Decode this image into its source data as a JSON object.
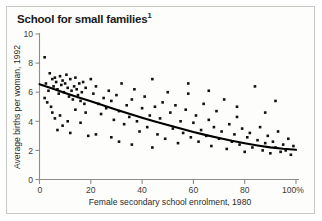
{
  "figure": {
    "title": "School for small families",
    "title_superscript": "1",
    "background_color": "#fdfdfb",
    "border_color": "#c8c8c4"
  },
  "chart_data": {
    "type": "scatter",
    "title": "School for small families",
    "xlabel": "Female secondary school enrolment, 1980",
    "ylabel": "Average births per woman, 1992",
    "xlim": [
      0,
      100
    ],
    "ylim": [
      0,
      10
    ],
    "xticks": [
      0,
      20,
      40,
      60,
      80,
      100
    ],
    "xtick_labels": [
      "0",
      "20",
      "40",
      "60",
      "80",
      "100%"
    ],
    "yticks": [
      0,
      2,
      4,
      6,
      8,
      10
    ],
    "ytick_labels": [
      "0",
      "2",
      "4",
      "6",
      "8",
      "10"
    ],
    "grid": false,
    "legend": null,
    "marker_color": "#111111",
    "marker_shape": "square",
    "trend": {
      "name": "fitted curve",
      "color": "#000000",
      "points": [
        [
          0.0,
          6.55
        ],
        [
          5.0,
          6.25
        ],
        [
          10.0,
          5.95
        ],
        [
          15.0,
          5.66
        ],
        [
          20.0,
          5.37
        ],
        [
          25.0,
          5.08
        ],
        [
          30.0,
          4.8
        ],
        [
          35.0,
          4.52
        ],
        [
          40.0,
          4.25
        ],
        [
          45.0,
          3.99
        ],
        [
          50.0,
          3.74
        ],
        [
          55.0,
          3.5
        ],
        [
          60.0,
          3.27
        ],
        [
          65.0,
          3.05
        ],
        [
          70.0,
          2.85
        ],
        [
          75.0,
          2.66
        ],
        [
          80.0,
          2.49
        ],
        [
          85.0,
          2.34
        ],
        [
          90.0,
          2.21
        ],
        [
          95.0,
          2.11
        ],
        [
          100.0,
          2.04
        ]
      ]
    },
    "points": [
      [
        2.0,
        8.4
      ],
      [
        3.5,
        6.1
      ],
      [
        2.5,
        6.6
      ],
      [
        4.0,
        7.3
      ],
      [
        5.0,
        6.9
      ],
      [
        5.5,
        6.4
      ],
      [
        6.0,
        7.0
      ],
      [
        6.5,
        6.7
      ],
      [
        7.0,
        6.2
      ],
      [
        7.5,
        5.9
      ],
      [
        8.0,
        7.1
      ],
      [
        8.5,
        6.5
      ],
      [
        9.0,
        6.8
      ],
      [
        9.5,
        6.0
      ],
      [
        10.0,
        6.6
      ],
      [
        10.5,
        7.2
      ],
      [
        11.0,
        6.3
      ],
      [
        11.5,
        5.7
      ],
      [
        12.0,
        6.9
      ],
      [
        12.5,
        6.1
      ],
      [
        13.0,
        5.5
      ],
      [
        13.5,
        6.4
      ],
      [
        14.0,
        7.0
      ],
      [
        14.5,
        6.2
      ],
      [
        15.0,
        5.8
      ],
      [
        15.5,
        6.6
      ],
      [
        16.0,
        5.4
      ],
      [
        16.5,
        6.0
      ],
      [
        17.0,
        6.7
      ],
      [
        17.5,
        5.2
      ],
      [
        18.0,
        6.3
      ],
      [
        3.0,
        5.3
      ],
      [
        4.5,
        5.0
      ],
      [
        2.0,
        5.6
      ],
      [
        5.0,
        4.6
      ],
      [
        6.0,
        4.2
      ],
      [
        8.0,
        4.4
      ],
      [
        9.0,
        3.7
      ],
      [
        7.0,
        3.4
      ],
      [
        11.0,
        4.0
      ],
      [
        12.0,
        3.2
      ],
      [
        14.0,
        4.8
      ],
      [
        16.0,
        3.9
      ],
      [
        18.0,
        4.6
      ],
      [
        19.0,
        3.0
      ],
      [
        20.0,
        6.9
      ],
      [
        21.0,
        5.9
      ],
      [
        22.0,
        6.4
      ],
      [
        23.0,
        5.2
      ],
      [
        24.0,
        4.5
      ],
      [
        25.0,
        5.6
      ],
      [
        26.0,
        4.9
      ],
      [
        27.0,
        6.1
      ],
      [
        28.0,
        5.4
      ],
      [
        29.0,
        4.1
      ],
      [
        30.0,
        5.8
      ],
      [
        31.0,
        4.7
      ],
      [
        32.0,
        6.6
      ],
      [
        33.0,
        3.8
      ],
      [
        34.0,
        5.1
      ],
      [
        35.0,
        4.3
      ],
      [
        36.0,
        5.5
      ],
      [
        37.0,
        6.2
      ],
      [
        38.0,
        4.0
      ],
      [
        39.0,
        3.3
      ],
      [
        40.0,
        4.9
      ],
      [
        41.0,
        5.7
      ],
      [
        42.0,
        3.6
      ],
      [
        43.0,
        4.4
      ],
      [
        44.0,
        6.9
      ],
      [
        45.0,
        5.0
      ],
      [
        46.0,
        3.1
      ],
      [
        47.0,
        4.2
      ],
      [
        48.0,
        5.3
      ],
      [
        49.0,
        2.8
      ],
      [
        50.0,
        6.0
      ],
      [
        51.0,
        4.6
      ],
      [
        52.0,
        3.5
      ],
      [
        53.0,
        5.1
      ],
      [
        54.0,
        2.5
      ],
      [
        55.0,
        4.0
      ],
      [
        56.0,
        3.2
      ],
      [
        57.0,
        4.8
      ],
      [
        58.0,
        5.9
      ],
      [
        59.0,
        2.9
      ],
      [
        60.0,
        3.9
      ],
      [
        61.0,
        4.4
      ],
      [
        62.0,
        2.6
      ],
      [
        63.0,
        3.4
      ],
      [
        64.0,
        5.2
      ],
      [
        65.0,
        3.0
      ],
      [
        66.0,
        4.1
      ],
      [
        67.0,
        2.3
      ],
      [
        68.0,
        3.6
      ],
      [
        69.0,
        4.7
      ],
      [
        70.0,
        2.8
      ],
      [
        71.0,
        3.3
      ],
      [
        72.0,
        5.5
      ],
      [
        73.0,
        2.1
      ],
      [
        74.0,
        3.8
      ],
      [
        75.0,
        2.6
      ],
      [
        76.0,
        3.1
      ],
      [
        77.0,
        4.3
      ],
      [
        78.0,
        2.4
      ],
      [
        79.0,
        3.5
      ],
      [
        80.0,
        1.9
      ],
      [
        81.0,
        2.9
      ],
      [
        82.0,
        3.2
      ],
      [
        83.0,
        2.2
      ],
      [
        84.0,
        6.4
      ],
      [
        85.0,
        2.7
      ],
      [
        86.0,
        3.6
      ],
      [
        87.0,
        2.0
      ],
      [
        88.0,
        2.5
      ],
      [
        89.0,
        3.0
      ],
      [
        90.0,
        1.8
      ],
      [
        91.0,
        2.6
      ],
      [
        92.0,
        2.2
      ],
      [
        93.0,
        3.3
      ],
      [
        94.0,
        1.9
      ],
      [
        95.0,
        2.4
      ],
      [
        96.0,
        2.0
      ],
      [
        97.0,
        2.8
      ],
      [
        98.0,
        1.7
      ],
      [
        99.0,
        2.3
      ],
      [
        88.0,
        4.6
      ],
      [
        92.0,
        5.4
      ],
      [
        66.0,
        6.1
      ],
      [
        77.0,
        5.0
      ],
      [
        58.0,
        6.6
      ],
      [
        36.0,
        2.4
      ],
      [
        44.0,
        2.2
      ],
      [
        28.0,
        2.9
      ],
      [
        22.0,
        3.1
      ],
      [
        31.0,
        2.6
      ]
    ]
  }
}
